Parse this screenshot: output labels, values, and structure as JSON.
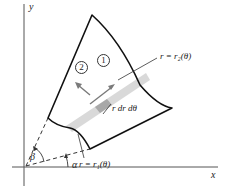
{
  "figure": {
    "axes": {
      "x_label": "x",
      "y_label": "y"
    },
    "curves": {
      "outer_label": "r = r₂(θ)",
      "inner_label": "r = r₁(θ)"
    },
    "element_label": "r dr dθ",
    "angles": {
      "alpha": "α",
      "beta": "β"
    },
    "order_markers": [
      {
        "label": "1",
        "direction": "radial (along wedge)"
      },
      {
        "label": "2",
        "direction": "angular (sweep in θ)"
      }
    ],
    "colors": {
      "line": "#111111",
      "axis": "#444444",
      "wedge_fill": "#d9d9d9",
      "element_fill": "#a8a8a8",
      "arrow": "#7a7a7a"
    }
  }
}
